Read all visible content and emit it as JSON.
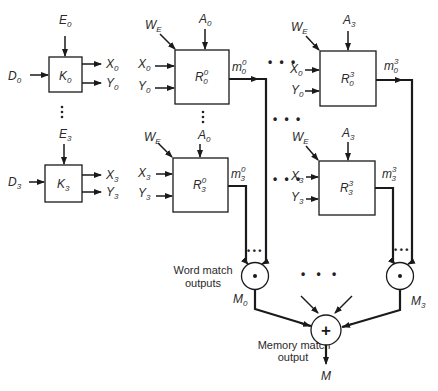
{
  "diagram": {
    "type": "block-diagram",
    "key_registers": [
      {
        "name": "K",
        "index": "0",
        "input_top": {
          "base": "E",
          "sub": "0"
        },
        "input_left": {
          "base": "D",
          "sub": "0"
        },
        "outputs": [
          {
            "base": "X",
            "sub": "0"
          },
          {
            "base": "Y",
            "sub": "0"
          }
        ]
      },
      {
        "name": "K",
        "index": "3",
        "input_top": {
          "base": "E",
          "sub": "3"
        },
        "input_left": {
          "base": "D",
          "sub": "3"
        },
        "outputs": [
          {
            "base": "X",
            "sub": "3"
          },
          {
            "base": "Y",
            "sub": "3"
          }
        ]
      }
    ],
    "cells": [
      {
        "id": "R00",
        "base": "R",
        "sup": "0",
        "sub": "0",
        "write_enable": {
          "base": "W",
          "sub": "E"
        },
        "addr": {
          "base": "A",
          "sub": "0"
        },
        "in_x": {
          "base": "X",
          "sub": "0"
        },
        "in_y": {
          "base": "Y",
          "sub": "0"
        },
        "out": {
          "base": "m",
          "sup": "0",
          "sub": "0"
        }
      },
      {
        "id": "R30",
        "base": "R",
        "sup": "0",
        "sub": "3",
        "write_enable": {
          "base": "W",
          "sub": "E"
        },
        "addr": {
          "base": "A",
          "sub": "0"
        },
        "in_x": {
          "base": "X",
          "sub": "3"
        },
        "in_y": {
          "base": "Y",
          "sub": "3"
        },
        "out": {
          "base": "m",
          "sup": "0",
          "sub": "3"
        }
      },
      {
        "id": "R03",
        "base": "R",
        "sup": "3",
        "sub": "0",
        "write_enable": {
          "base": "W",
          "sub": "E"
        },
        "addr": {
          "base": "A",
          "sub": "3"
        },
        "in_x": {
          "base": "X",
          "sub": "0"
        },
        "in_y": {
          "base": "Y",
          "sub": "0"
        },
        "out": {
          "base": "m",
          "sup": "3",
          "sub": "0"
        }
      },
      {
        "id": "R33",
        "base": "R",
        "sup": "3",
        "sub": "3",
        "write_enable": {
          "base": "W",
          "sub": "E"
        },
        "addr": {
          "base": "A",
          "sub": "3"
        },
        "in_x": {
          "base": "X",
          "sub": "3"
        },
        "in_y": {
          "base": "Y",
          "sub": "3"
        },
        "out": {
          "base": "m",
          "sup": "3",
          "sub": "3"
        }
      }
    ],
    "and_gates": [
      {
        "symbol": "•",
        "output": {
          "base": "M",
          "sub": "0"
        }
      },
      {
        "symbol": "•",
        "output": {
          "base": "M",
          "sub": "3"
        }
      }
    ],
    "or_gate": {
      "symbol": "+",
      "output": {
        "base": "M"
      }
    },
    "captions": {
      "word_match_line1": "Word match",
      "word_match_line2": "outputs",
      "memory_match_line1": "Memory match",
      "memory_match_line2": "output"
    },
    "ellipsis_h": "• • •",
    "ellipsis_v": "⋮"
  }
}
